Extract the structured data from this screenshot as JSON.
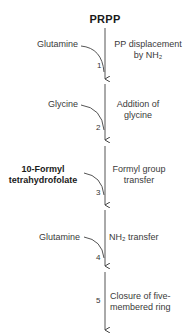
{
  "diagram": {
    "start_compound": "PRPP",
    "steps": [
      {
        "number": "1",
        "substrate": "Glutamine",
        "description_line1": "PP displacement",
        "description_line2": "by NH₂"
      },
      {
        "number": "2",
        "substrate": "Glycine",
        "description_line1": "Addition of",
        "description_line2": "glycine"
      },
      {
        "number": "3",
        "substrate_line1": "10-Formyl",
        "substrate_line2": "tetrahydrofolate",
        "description_line1": "Formyl group",
        "description_line2": "transfer"
      },
      {
        "number": "4",
        "substrate": "Glutamine",
        "description_line1": "NH₂ transfer"
      },
      {
        "number": "5",
        "description_line1": "Closure of five-",
        "description_line2": "membered ring"
      }
    ],
    "colors": {
      "line": "#444444",
      "text": "#2a2a2a"
    }
  }
}
